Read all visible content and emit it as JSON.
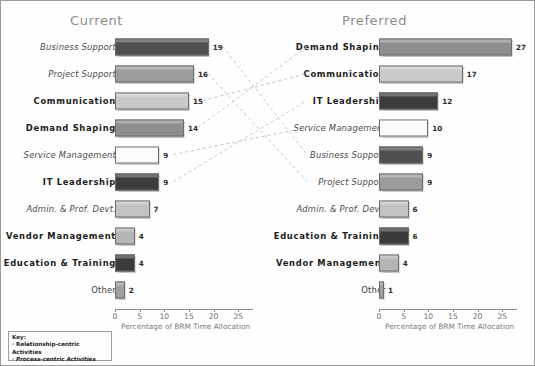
{
  "chart_data": {
    "type": "bar",
    "title": "",
    "xlabel": "Percentage of BRM Time Allocation",
    "ylabel": "",
    "xlim": [
      0,
      28
    ],
    "ticks": [
      0,
      5,
      10,
      15,
      20,
      25
    ],
    "grid": false,
    "orientation": "horizontal",
    "panels": [
      {
        "name": "current",
        "title": "Current",
        "axis_title": "Percentage of BRM Time Allocation",
        "categories": [
          "Business Support",
          "Project Support",
          "Communication",
          "Demand Shaping",
          "Service Management",
          "IT Leadership",
          "Admin. & Prof. Devt.",
          "Vendor Management",
          "Education & Training",
          "Other"
        ],
        "values": [
          19,
          16,
          15,
          14,
          9,
          9,
          7,
          4,
          4,
          2
        ],
        "bars": [
          {
            "label": "Business Support",
            "value": 19,
            "kind": "process",
            "color": "#4f4f4f"
          },
          {
            "label": "Project Support",
            "value": 16,
            "kind": "process",
            "color": "#9c9c9c"
          },
          {
            "label": "Communication",
            "value": 15,
            "kind": "relationship",
            "color": "#c9c9c9"
          },
          {
            "label": "Demand Shaping",
            "value": 14,
            "kind": "relationship",
            "color": "#8e8e8e"
          },
          {
            "label": "Service Management",
            "value": 9,
            "kind": "process",
            "color": "#fbfbfb"
          },
          {
            "label": "IT Leadership",
            "value": 9,
            "kind": "relationship",
            "color": "#3c3c3c"
          },
          {
            "label": "Admin. & Prof. Devt.",
            "value": 7,
            "kind": "process",
            "color": "#c2c2c2"
          },
          {
            "label": "Vendor Management",
            "value": 4,
            "kind": "relationship",
            "color": "#b5b5b5"
          },
          {
            "label": "Education & Training",
            "value": 4,
            "kind": "relationship",
            "color": "#3a3a3a"
          },
          {
            "label": "Other",
            "value": 2,
            "kind": "neutral",
            "color": "#9f9f9f"
          }
        ]
      },
      {
        "name": "preferred",
        "title": "Preferred",
        "axis_title": "Percentage of BRM Time Allocation",
        "categories": [
          "Demand Shaping",
          "Communication",
          "IT Leadership",
          "Service Management",
          "Business Support",
          "Project Support",
          "Admin. & Prof. Devt.",
          "Education & Training",
          "Vendor Management",
          "Other"
        ],
        "values": [
          27,
          17,
          12,
          10,
          9,
          9,
          6,
          6,
          4,
          1
        ],
        "bars": [
          {
            "label": "Demand Shaping",
            "value": 27,
            "kind": "relationship",
            "color": "#8e8e8e"
          },
          {
            "label": "Communication",
            "value": 17,
            "kind": "relationship",
            "color": "#c9c9c9"
          },
          {
            "label": "IT Leadership",
            "value": 12,
            "kind": "relationship",
            "color": "#3c3c3c"
          },
          {
            "label": "Service Management",
            "value": 10,
            "kind": "process",
            "color": "#fbfbfb"
          },
          {
            "label": "Business Support",
            "value": 9,
            "kind": "process",
            "color": "#4f4f4f"
          },
          {
            "label": "Project Support",
            "value": 9,
            "kind": "process",
            "color": "#9c9c9c"
          },
          {
            "label": "Admin. & Prof. Devt.",
            "value": 6,
            "kind": "process",
            "color": "#c2c2c2"
          },
          {
            "label": "Education & Training",
            "value": 6,
            "kind": "relationship",
            "color": "#3a3a3a"
          },
          {
            "label": "Vendor Management",
            "value": 4,
            "kind": "relationship",
            "color": "#b5b5b5"
          },
          {
            "label": "Other",
            "value": 1,
            "kind": "neutral",
            "color": "#9f9f9f"
          }
        ]
      }
    ],
    "connectors": [
      {
        "category": "Business Support",
        "from_index": 0,
        "to_index": 4
      },
      {
        "category": "Project Support",
        "from_index": 1,
        "to_index": 5
      },
      {
        "category": "Communication",
        "from_index": 2,
        "to_index": 1
      },
      {
        "category": "Demand Shaping",
        "from_index": 3,
        "to_index": 0
      },
      {
        "category": "Service Management",
        "from_index": 4,
        "to_index": 3
      },
      {
        "category": "IT Leadership",
        "from_index": 5,
        "to_index": 2
      }
    ]
  },
  "key": {
    "title": "Key:",
    "items": [
      {
        "text": "· Relationship-centric Activities",
        "style": "relationship"
      },
      {
        "text": "· Process-centric Activities",
        "style": "process"
      }
    ]
  }
}
